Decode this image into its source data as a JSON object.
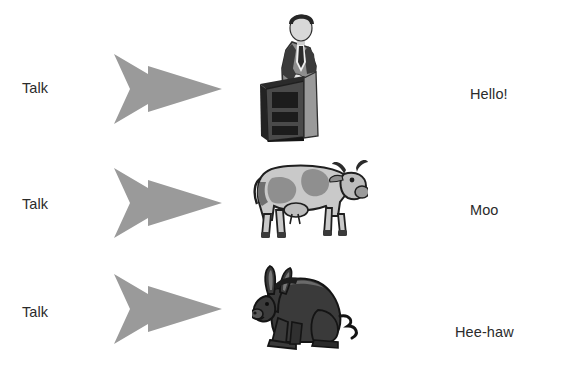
{
  "diagram": {
    "background_color": "#ffffff",
    "text_color": "#2b2b2b",
    "arrow_color": "#9a9a9a",
    "rows": [
      {
        "stimulus": "Talk",
        "arrow": "right-arrow",
        "actor": "speaker-at-podium",
        "response": "Hello!"
      },
      {
        "stimulus": "Talk",
        "arrow": "right-arrow",
        "actor": "cow",
        "response": "Moo"
      },
      {
        "stimulus": "Talk",
        "arrow": "right-arrow",
        "actor": "donkey",
        "response": "Hee-haw"
      }
    ]
  }
}
